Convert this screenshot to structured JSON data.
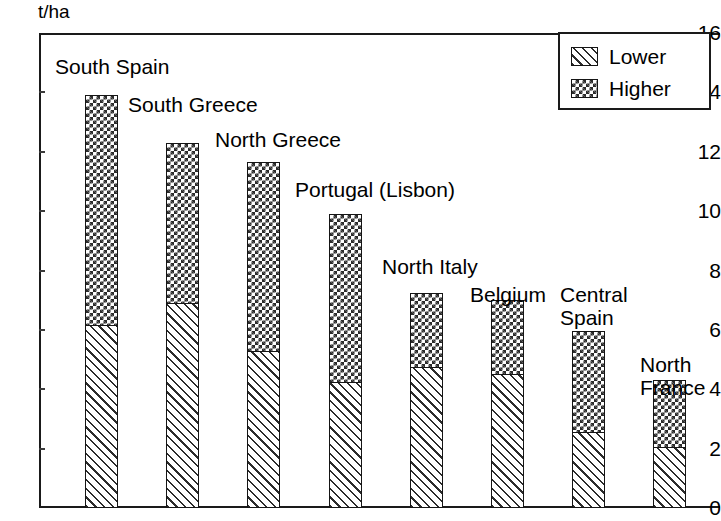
{
  "axis": {
    "unit_label": "t/ha",
    "y_ticks": [
      "16",
      "14",
      "12",
      "10",
      "8",
      "6",
      "4",
      "2",
      "0"
    ]
  },
  "legend": {
    "items": [
      {
        "label": "Lower",
        "pattern": "diagonal-hatch"
      },
      {
        "label": "Higher",
        "pattern": "checkerboard"
      }
    ]
  },
  "chart_data": {
    "type": "bar",
    "title": "",
    "subtitle": "",
    "xlabel": "",
    "ylabel": "t/ha",
    "ylim": [
      0,
      16
    ],
    "ytick_step": 2,
    "grid": false,
    "stacked": true,
    "legend_position": "top-right",
    "categories": [
      "South Spain",
      "South Greece",
      "North Greece",
      "Portugal (Lisbon)",
      "North Italy",
      "Belgium",
      "Central Spain",
      "North France"
    ],
    "series": [
      {
        "name": "Lower",
        "values": [
          6.15,
          6.9,
          5.3,
          4.25,
          4.75,
          4.5,
          2.55,
          2.05
        ]
      },
      {
        "name": "Higher",
        "values": [
          7.75,
          5.4,
          6.35,
          5.65,
          2.5,
          2.5,
          3.4,
          2.25
        ]
      }
    ],
    "totals": [
      13.9,
      12.3,
      11.65,
      9.9,
      7.25,
      7.0,
      5.95,
      4.3
    ]
  },
  "bar_labels": [
    {
      "text": "South Spain",
      "left": 55,
      "top": 55
    },
    {
      "text": "South Greece",
      "left": 128,
      "top": 93
    },
    {
      "text": "North Greece",
      "left": 215,
      "top": 128
    },
    {
      "text": "Portugal (Lisbon)",
      "left": 295,
      "top": 178
    },
    {
      "text": "North Italy",
      "left": 382,
      "top": 255
    },
    {
      "text": "Belgium",
      "left": 470,
      "top": 283
    },
    {
      "text": "Central\nSpain",
      "left": 560,
      "top": 283
    },
    {
      "text": "North\nFrance",
      "left": 640,
      "top": 353
    }
  ]
}
